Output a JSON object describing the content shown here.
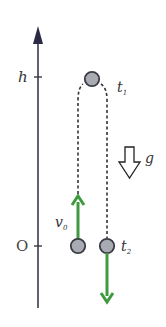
{
  "diagram": {
    "axis": {
      "top_label": "h",
      "origin_label": "O"
    },
    "labels": {
      "t1_main": "t",
      "t1_sub": "1",
      "t2_main": "t",
      "t2_sub": "2",
      "v0_main": "v",
      "v0_sub": "0",
      "gravity": "g"
    },
    "colors": {
      "axis": "#3a3a4a",
      "arrowhead": "#2a2a44",
      "ball_fill": "#a9abb3",
      "ball_stroke": "#3b3b45",
      "velocity_arrow": "#3f9a3f",
      "dashed_path": "#333333",
      "gravity_arrow_stroke": "#222222"
    },
    "icons": {
      "gravity": "hollow-down-arrow",
      "velocity_up": "green-up-arrow",
      "velocity_down": "green-down-arrow"
    }
  }
}
